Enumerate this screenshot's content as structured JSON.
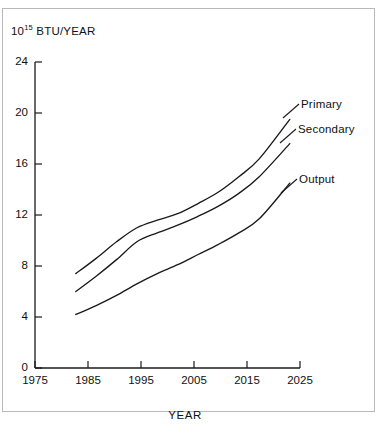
{
  "figure": {
    "y_axis_title_mantissa": "10",
    "y_axis_title_exponent": "15",
    "y_axis_title_unit": " BTU/YEAR",
    "x_axis_title": "YEAR"
  },
  "chart_data": {
    "type": "line",
    "xlabel": "YEAR",
    "ylabel": "10^15 BTU/YEAR",
    "xlim": [
      1975,
      2027
    ],
    "ylim": [
      0,
      24
    ],
    "xticks": [
      "1975",
      "1985",
      "1995",
      "2005",
      "2015",
      "2025"
    ],
    "yticks": [
      "0",
      "4",
      "8",
      "12",
      "16",
      "20",
      "24"
    ],
    "grid": false,
    "legend_position": "right-inline-annotations",
    "x": [
      1983,
      1987,
      1991,
      1995,
      1999,
      2003,
      2007,
      2011,
      2015,
      2019,
      2025
    ],
    "series": [
      {
        "name": "Primary",
        "values": [
          7.4,
          8.6,
          9.9,
          11.0,
          11.6,
          12.1,
          12.9,
          13.8,
          15.0,
          16.4,
          19.5
        ]
      },
      {
        "name": "Secondary",
        "values": [
          6.0,
          7.2,
          8.5,
          9.9,
          10.6,
          11.2,
          11.9,
          12.7,
          13.7,
          15.0,
          17.6
        ]
      },
      {
        "name": "Output",
        "values": [
          4.2,
          4.9,
          5.7,
          6.6,
          7.4,
          8.1,
          8.9,
          9.7,
          10.6,
          11.7,
          14.5
        ]
      }
    ],
    "annotations": [
      {
        "text": "Primary",
        "x": 2025,
        "y": 19.5
      },
      {
        "text": "Secondary",
        "x": 2025,
        "y": 17.6
      },
      {
        "text": "Output",
        "x": 2025,
        "y": 14.5
      }
    ]
  }
}
